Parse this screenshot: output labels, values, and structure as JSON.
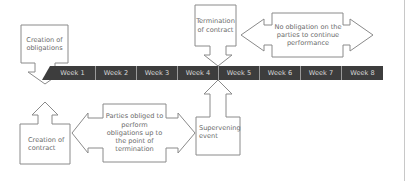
{
  "diagram": {
    "type": "timeline",
    "colors": {
      "timeline_bg": "#3d3d3d",
      "timeline_text": "#d8d8d8",
      "shape_stroke": "#8a8a8a",
      "label_text": "#6a6a6a"
    },
    "timeline": {
      "weeks": [
        "Week 1",
        "Week 2",
        "Week 3",
        "Week 4",
        "Week 5",
        "Week 6",
        "Week 7",
        "Week 8"
      ]
    },
    "callouts": {
      "creation_of_obligations": "Creation of\nobligations",
      "termination_of_contract": "Termination\nof contract",
      "no_obligation": "No obligation on the\nparties to continue\nperformance",
      "creation_of_contract": "Creation of\ncontract",
      "parties_obliged": "Parties obliged to\nperform\nobligations up to\nthe point of\ntermination",
      "supervening_event": "Supervening\nevent"
    }
  }
}
